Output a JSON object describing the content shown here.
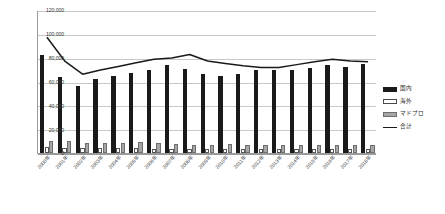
{
  "chart_data": {
    "type": "bar",
    "title": "",
    "xlabel": "",
    "ylabel": "",
    "ylim": [
      0,
      120000
    ],
    "ytick_step": 20000,
    "grid": true,
    "legend_position": "right",
    "categories": [
      "2000年",
      "2001年",
      "2002年",
      "2003年",
      "2004年",
      "2005年",
      "2006年",
      "2007年",
      "2008年",
      "2009年",
      "2010年",
      "2011年",
      "2012年",
      "2013年",
      "2014年",
      "2015年",
      "2016年",
      "2017年",
      "2018年"
    ],
    "ytick_labels": [
      "0",
      "20,000",
      "40,000",
      "60,000",
      "80,000",
      "100,000",
      "120,000"
    ],
    "series": [
      {
        "name": "国内",
        "style": "bar",
        "color": "#1a1a1a",
        "values": [
          82000,
          63500,
          56500,
          62500,
          64500,
          67500,
          69500,
          73500,
          70500,
          66000,
          64500,
          66000,
          70000,
          70000,
          69500,
          71500,
          73500,
          72500,
          74500
        ]
      },
      {
        "name": "海外",
        "style": "bar",
        "color": "#ffffff",
        "values": [
          5200,
          4500,
          4200,
          4000,
          3900,
          3800,
          3700,
          3600,
          3500,
          3400,
          3300,
          3300,
          3300,
          3200,
          3200,
          3200,
          3200,
          3100,
          3100
        ]
      },
      {
        "name": "マドプロ",
        "style": "bar",
        "color": "#a6a6a6",
        "values": [
          10500,
          10000,
          8800,
          8500,
          8800,
          9000,
          8500,
          7500,
          7000,
          6800,
          7200,
          7000,
          6800,
          6500,
          6500,
          6800,
          7000,
          7000,
          6500
        ]
      },
      {
        "name": "合計",
        "style": "line",
        "color": "#1a1a1a",
        "values": [
          98000,
          78000,
          67000,
          70500,
          73500,
          76500,
          79500,
          80500,
          83500,
          78000,
          76000,
          74000,
          72500,
          72500,
          75000,
          77500,
          79500,
          78000,
          77500
        ]
      }
    ]
  },
  "legend": {
    "items": [
      {
        "label": "国内",
        "swatch": "s0"
      },
      {
        "label": "海外",
        "swatch": "s1"
      },
      {
        "label": "マドプロ",
        "swatch": "s2"
      },
      {
        "label": "合計",
        "swatch": "s3"
      }
    ]
  }
}
